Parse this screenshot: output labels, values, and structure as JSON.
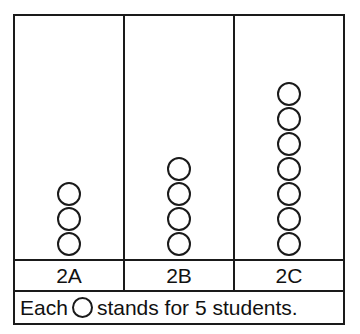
{
  "chart_data": {
    "type": "pictograph",
    "title": "",
    "xlabel": "",
    "ylabel": "",
    "categories": [
      "2A",
      "2B",
      "2C"
    ],
    "symbol_counts": [
      3,
      4,
      7
    ],
    "symbol_value": 5,
    "values": [
      15,
      20,
      35
    ],
    "symbol_shape": "circle",
    "legend": {
      "text_before": "Each",
      "text_after": "stands for 5 students.",
      "full_text": "Each ○ stands for 5 students.",
      "unit": "students",
      "value_per_symbol": 5
    },
    "grid": false,
    "legend_position": "bottom",
    "orientation": "vertical",
    "colors": {
      "border": "#1a1a1a",
      "symbol_stroke": "#1a1a1a",
      "symbol_fill": "transparent",
      "background": "#ffffff",
      "text": "#111111"
    }
  },
  "columns": [
    {
      "label": "2A",
      "count": 3
    },
    {
      "label": "2B",
      "count": 4
    },
    {
      "label": "2C",
      "count": 7
    }
  ],
  "legend": {
    "text_before": "Each",
    "text_after": "stands for 5 students."
  }
}
